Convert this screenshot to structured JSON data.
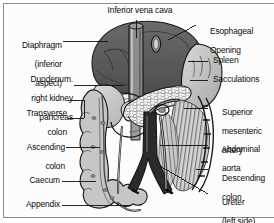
{
  "figure": {
    "kind": "anatomical-illustration",
    "orientation": "left side of page = patient right; right side of page = patient left"
  },
  "palette": {
    "background": "#fcfcfc",
    "frame_border": "#8d8d8d",
    "text": "#0b0b0b",
    "leader_line": "#111111",
    "diaphragm_dark": "#595959",
    "diaphragm_mid": "#6e6e6e",
    "organ_light": "#cfcfcf",
    "organ_mid": "#b2b2b2",
    "organ_pale": "#dddddd",
    "vessel_dark": "#2a2a2a",
    "vessel_mid": "#8a8a8a",
    "outline": "#1a1a1a",
    "mesentery_hatch": "#6a6a6a"
  },
  "labels": {
    "top": [
      {
        "id": "inferior-vena-cava",
        "text": "Inferior vena cava",
        "align": "center",
        "x": 140,
        "y": 8,
        "leader": "vertical"
      }
    ],
    "left": [
      {
        "id": "diaphragm",
        "lines": [
          "Diaphragm",
          "(inferior",
          "aspect)"
        ],
        "x": 8,
        "y": 36,
        "leader": "horizontal"
      },
      {
        "id": "duodenum-right-kidney-pancreas",
        "lines": [
          "Duodenum.",
          "right kidney",
          "pancreas"
        ],
        "x": 8,
        "y": 76,
        "leader": "horizontal"
      },
      {
        "id": "transverse-colon",
        "lines": [
          "Transverse",
          "colon"
        ],
        "x": 8,
        "y": 113,
        "leader": "bracket"
      },
      {
        "id": "ascending-colon",
        "lines": [
          "Ascending",
          "colon"
        ],
        "x": 8,
        "y": 142,
        "leader": "horizontal"
      },
      {
        "id": "caecum",
        "lines": [
          "Caecum"
        ],
        "x": 8,
        "y": 177,
        "leader": "horizontal"
      },
      {
        "id": "appendix",
        "lines": [
          "Appendix"
        ],
        "x": 8,
        "y": 201,
        "leader": "horizontal"
      }
    ],
    "right": [
      {
        "id": "esophageal-opening",
        "lines": [
          "Esophageal",
          "Opening"
        ],
        "x": 200,
        "y": 18,
        "leader": "diagonal"
      },
      {
        "id": "spleen",
        "lines": [
          "Spleen"
        ],
        "x": 213,
        "y": 57,
        "leader": "horizontal"
      },
      {
        "id": "sacculations",
        "lines": [
          "Sacculations"
        ],
        "x": 213,
        "y": 76,
        "leader": "horizontal",
        "clipped_at_right_edge": true
      },
      {
        "id": "superior-mesenteric-artery",
        "lines": [
          "Superior",
          "mesenteric",
          "artery"
        ],
        "x": 213,
        "y": 103,
        "leader": "horizontal"
      },
      {
        "id": "abdominal-aorta",
        "lines": [
          "Abdominal",
          "aorta"
        ],
        "x": 213,
        "y": 140,
        "leader": "horizontal"
      },
      {
        "id": "descending-colon",
        "lines": [
          "Descending",
          "colon"
        ],
        "x": 213,
        "y": 165,
        "leader": "horizontal",
        "clipped_at_right_edge": true
      },
      {
        "id": "ureter-left-side",
        "lines": [
          "Ureter",
          "(left side)"
        ],
        "x": 213,
        "y": 190,
        "leader": "diagonal"
      }
    ]
  }
}
